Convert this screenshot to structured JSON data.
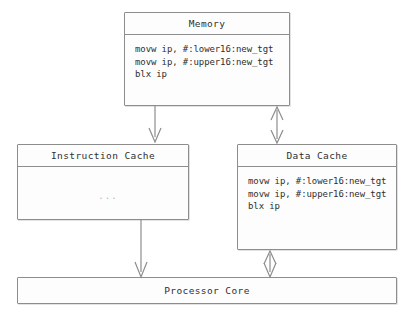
{
  "diagram": {
    "accent_color": "#8d8d8d",
    "text_color": "#2f2f2f",
    "background_color": "#ffffff"
  },
  "nodes": {
    "memory": {
      "title": "Memory",
      "code": [
        "movw ip, #:lower16:new_tgt",
        "movw ip, #:upper16:new_tgt",
        "blx ip"
      ]
    },
    "instruction_cache": {
      "title": "Instruction Cache",
      "body_text": "..."
    },
    "data_cache": {
      "title": "Data Cache",
      "code": [
        "movw ip, #:lower16:new_tgt",
        "movw ip, #:upper16:new_tgt",
        "blx ip"
      ]
    },
    "processor_core": {
      "title": "Processor Core"
    }
  },
  "connectors": [
    {
      "name": "memory-to-instruction-cache",
      "from": "memory",
      "to": "instruction_cache",
      "direction": "down",
      "arrowheads": "single"
    },
    {
      "name": "memory-to-data-cache",
      "from": "memory",
      "to": "data_cache",
      "direction": "bidirectional",
      "arrowheads": "double"
    },
    {
      "name": "instruction-cache-to-processor-core",
      "from": "instruction_cache",
      "to": "processor_core",
      "direction": "down",
      "arrowheads": "single"
    },
    {
      "name": "data-cache-to-processor-core",
      "from": "data_cache",
      "to": "processor_core",
      "direction": "bidirectional",
      "arrowheads": "double"
    }
  ]
}
